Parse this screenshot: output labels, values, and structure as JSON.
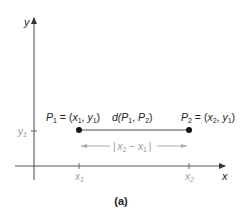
{
  "diagram": {
    "caption": "(a)",
    "axes": {
      "x_label": "x",
      "y_label": "y"
    },
    "points": [
      {
        "name": "P",
        "sub": "1",
        "eq": " = (",
        "coord_x": "x",
        "coord_x_sub": "1",
        "sep": ", ",
        "coord_y": "y",
        "coord_y_sub": "1",
        "close": ")"
      },
      {
        "name": "P",
        "sub": "2",
        "eq": " = (",
        "coord_x": "x",
        "coord_x_sub": "2",
        "sep": ", ",
        "coord_y": "y",
        "coord_y_sub": "1",
        "close": ")"
      }
    ],
    "segment_label": {
      "d": "d(",
      "p1": "P",
      "p1_sub": "1",
      "comma": ", ",
      "p2": "P",
      "p2_sub": "2",
      "close": ")"
    },
    "distance_label": {
      "bar_l": "|",
      "x2": "x",
      "x2_sub": "2",
      "minus": " − ",
      "x1": "x",
      "x1_sub": "1",
      "bar_r": "|"
    },
    "ticks": {
      "y1": {
        "v": "y",
        "sub": "1"
      },
      "x1": {
        "v": "x",
        "sub": "1"
      },
      "x2": {
        "v": "x",
        "sub": "2"
      }
    },
    "colors": {
      "axis": "#555555",
      "segment": "#8a8a8a",
      "point": "#111111",
      "muted": "#9a9a9a"
    }
  }
}
